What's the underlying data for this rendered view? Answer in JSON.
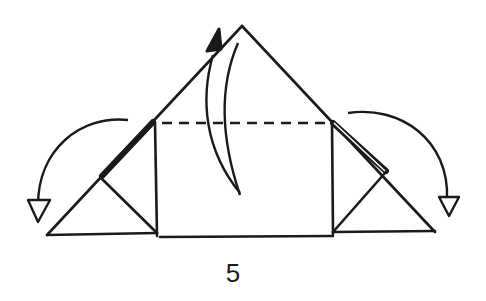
{
  "diagram": {
    "type": "origami-fold-step",
    "step_number": "5",
    "ink_color": "#1a1a1a",
    "background": "#ffffff",
    "elements": [
      "outer-triangle",
      "central-rectangle",
      "dashed-valley-fold-line",
      "left-corner-flap",
      "right-corner-flap",
      "left-fold-arrow",
      "right-fold-arrow",
      "center-upward-fold-arrow"
    ]
  }
}
